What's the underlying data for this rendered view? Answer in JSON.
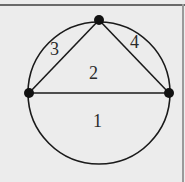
{
  "diagram": {
    "type": "inscribed-triangle-in-circle",
    "nodes": [
      {
        "id": "left",
        "x": 29,
        "y": 93
      },
      {
        "id": "top",
        "x": 99,
        "y": 20
      },
      {
        "id": "right",
        "x": 169,
        "y": 93
      }
    ],
    "region_labels": {
      "r1": "1",
      "r2": "2",
      "r3": "3",
      "r4": "4"
    },
    "colors": {
      "background": "#ececec",
      "stroke": "#1a1a1a"
    }
  }
}
